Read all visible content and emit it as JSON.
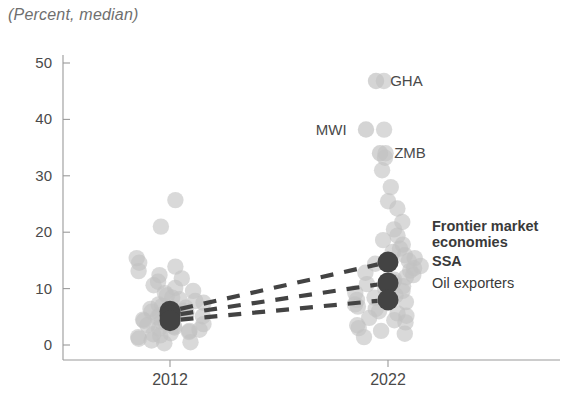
{
  "chart_data": {
    "type": "scatter",
    "title": "(Percent, median)",
    "xlabel": "",
    "ylabel": "",
    "ylim": [
      0,
      50
    ],
    "yticks": [
      0,
      10,
      20,
      30,
      40,
      50
    ],
    "categories": [
      "2012",
      "2022"
    ],
    "grid": false,
    "legend_position": "right-inline",
    "colors": {
      "scatter_dot": "#c2c2c2",
      "median_marker": "#434343",
      "axis": "#9a9a9a",
      "text": "#4a4a4a",
      "title": "#6f6f6f"
    },
    "series": [
      {
        "name": "Frontier market economies",
        "style": "median-marker",
        "bold": true,
        "values": [
          6.0,
          14.7
        ]
      },
      {
        "name": "SSA",
        "style": "median-marker",
        "bold": true,
        "values": [
          5.2,
          11.0
        ]
      },
      {
        "name": "Oil exporters",
        "style": "median-marker",
        "bold": false,
        "values": [
          4.3,
          8.0
        ]
      }
    ],
    "scatter": {
      "2012": [
        25.7,
        21.0,
        15.4,
        14.6,
        13.9,
        13.1,
        12.4,
        11.8,
        11.2,
        10.6,
        10.1,
        9.6,
        9.2,
        8.8,
        8.4,
        8.1,
        7.8,
        7.5,
        7.2,
        6.9,
        6.6,
        6.4,
        6.1,
        5.9,
        5.7,
        5.5,
        5.3,
        5.1,
        4.9,
        4.7,
        4.5,
        4.3,
        4.1,
        3.9,
        3.7,
        3.5,
        3.3,
        3.1,
        2.9,
        2.7,
        2.5,
        2.3,
        2.1,
        1.9,
        1.7,
        1.4,
        1.1,
        0.8,
        0.5,
        0.3
      ],
      "2022": [
        46.8,
        38.2,
        34.0,
        33.2,
        31.0,
        28.0,
        25.5,
        24.2,
        21.8,
        20.5,
        19.4,
        18.6,
        17.8,
        17.1,
        16.5,
        15.9,
        15.4,
        14.9,
        14.4,
        14.0,
        13.6,
        13.2,
        12.8,
        12.4,
        12.0,
        11.6,
        11.2,
        10.8,
        10.4,
        10.0,
        9.6,
        9.2,
        8.8,
        8.4,
        8.0,
        7.6,
        7.2,
        6.8,
        6.4,
        6.0,
        5.6,
        5.2,
        4.8,
        4.4,
        4.0,
        3.5,
        3.0,
        2.5,
        2.0,
        1.4
      ]
    },
    "annotations": [
      {
        "label": "GHA",
        "x_category": "2022",
        "value": 46.8
      },
      {
        "label": "MWI",
        "x_category": "2022",
        "value": 38.2
      },
      {
        "label": "ZMB",
        "x_category": "2022",
        "value": 34.0
      }
    ]
  }
}
